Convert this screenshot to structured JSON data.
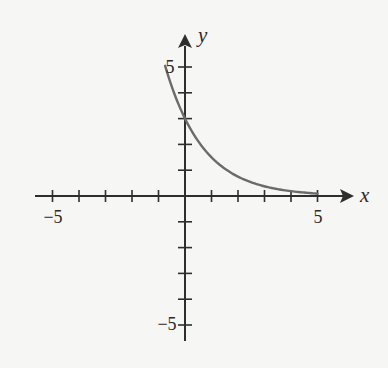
{
  "chart_data": {
    "type": "line",
    "title": "",
    "function": "y = 3(1/2)^x",
    "xlabel": "x",
    "ylabel": "y",
    "xlim": [
      -5,
      5
    ],
    "ylim": [
      -5,
      5
    ],
    "grid": false,
    "legend": null,
    "x_ticks": [
      -5,
      -4,
      -3,
      -2,
      -1,
      1,
      2,
      3,
      4,
      5
    ],
    "y_ticks": [
      -5,
      -4,
      -3,
      -2,
      -1,
      1,
      2,
      3,
      4,
      5
    ],
    "x_tick_labels": [
      {
        "value": -5,
        "label": "−5"
      },
      {
        "value": 5,
        "label": "5"
      }
    ],
    "y_tick_labels": [
      {
        "value": 5,
        "label": "5"
      },
      {
        "value": -5,
        "label": "−5"
      }
    ],
    "series": [
      {
        "name": "exponential decay",
        "color": "#6b6b6b",
        "x": [
          -0.75,
          -0.5,
          0,
          0.5,
          1,
          1.5,
          2,
          2.5,
          3,
          3.5,
          4,
          4.5,
          5
        ],
        "y": [
          5.05,
          4.24,
          3.0,
          2.12,
          1.5,
          1.06,
          0.75,
          0.53,
          0.38,
          0.27,
          0.19,
          0.13,
          0.09
        ]
      }
    ]
  },
  "labels": {
    "x_axis": "x",
    "y_axis": "y",
    "x_min": "−5",
    "x_max": "5",
    "y_max": "5",
    "y_min": "−5"
  },
  "colors": {
    "axis": "#2e2e2e",
    "curve": "#6b6b6b",
    "background": "#f6f6f5"
  }
}
